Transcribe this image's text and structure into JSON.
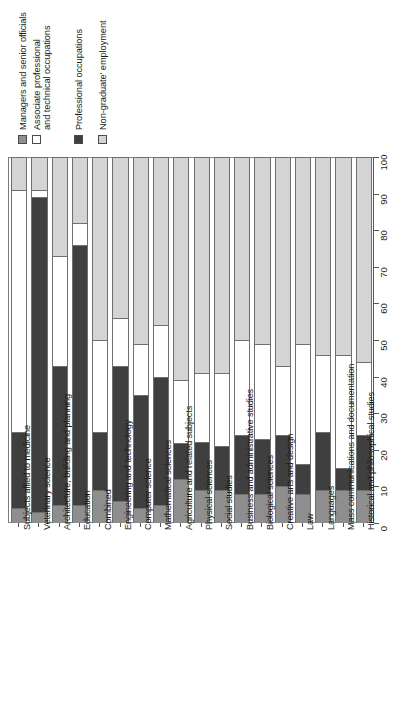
{
  "chart_data": {
    "type": "bar",
    "subtype": "stacked-horizontal-percent",
    "title": "",
    "xlabel": "",
    "ylabel": "",
    "value_axis": {
      "min": 0,
      "max": 100,
      "step": 10,
      "ticks": [
        "0",
        "10",
        "20",
        "30",
        "40",
        "50",
        "60",
        "70",
        "80",
        "90",
        "100"
      ],
      "position": "right",
      "grid": false
    },
    "legend": {
      "position": "top-left",
      "entries": [
        {
          "label": "Managers and senior officials",
          "color": "#8e8e8e",
          "lines": [
            "Managers and senior officials"
          ]
        },
        {
          "label": "Associate professional and technical occupations",
          "color": "#ffffff",
          "lines": [
            "Associate professional",
            "and technical occupations"
          ]
        },
        {
          "label": "Professional occupations",
          "color": "#3f3f3f",
          "lines": [
            "Professional occupations"
          ]
        },
        {
          "label": "Non-graduate' employment",
          "color": "#d4d4d4",
          "lines": [
            "Non-graduate' employment"
          ]
        }
      ]
    },
    "series": [
      {
        "name": "Managers and senior officials",
        "color": "#8e8e8e",
        "values": [
          4,
          3,
          5,
          5,
          9,
          6,
          4,
          5,
          12,
          9,
          9,
          8,
          8,
          10,
          8,
          9,
          9,
          9
        ]
      },
      {
        "name": "Professional occupations",
        "color": "#3f3f3f",
        "values": [
          21,
          86,
          38,
          71,
          16,
          37,
          31,
          35,
          10,
          13,
          12,
          16,
          15,
          14,
          8,
          16,
          6,
          15
        ]
      },
      {
        "name": "Associate professional and technical occupations",
        "color": "#ffffff",
        "values": [
          66,
          2,
          30,
          6,
          25,
          13,
          14,
          14,
          17,
          19,
          20,
          26,
          26,
          19,
          33,
          21,
          31,
          20
        ]
      },
      {
        "name": "Non-graduate' employment",
        "color": "#d4d4d4",
        "values": [
          9,
          9,
          27,
          18,
          50,
          44,
          51,
          46,
          61,
          59,
          59,
          50,
          51,
          57,
          51,
          54,
          54,
          56
        ]
      }
    ],
    "categories": [
      "Subjects allied to medicine",
      "Veterinary science",
      "Architecture, building and planning",
      "Education",
      "Combined",
      "Engineering and technology",
      "Computer science",
      "Mathematical sciences",
      "Agriculture and related subjects",
      "Physical sciences",
      "Social studies",
      "Business and administrative studies",
      "Biological sciences",
      "Creative arts and design",
      "Law",
      "Languages",
      "Mass communications and documentation",
      "Historical and philosophical studies"
    ]
  }
}
